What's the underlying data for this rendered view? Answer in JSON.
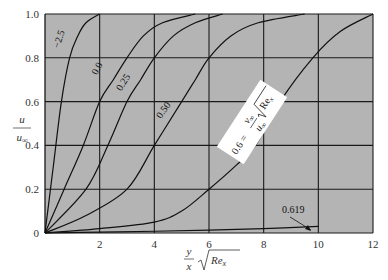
{
  "chart_data": {
    "type": "line",
    "title": "",
    "xlabel": "(y/x)·√Re_x",
    "ylabel": "u / u∞",
    "xlim": [
      0,
      12
    ],
    "ylim": [
      0,
      1.0
    ],
    "x_ticks": [
      "2",
      "4",
      "6",
      "8",
      "10",
      "12"
    ],
    "y_ticks": [
      "0",
      "0.2",
      "0.4",
      "0.6",
      "0.8",
      "1.0"
    ],
    "grid": true,
    "background": "#b4b4b4",
    "parameter_annotation": "0.6 = (v∞/u∞)·√Re_x",
    "series": [
      {
        "name": "−2.5",
        "x": [
          0,
          0.3,
          0.6,
          0.9,
          1.2,
          1.5,
          2.0
        ],
        "y": [
          0,
          0.3,
          0.6,
          0.8,
          0.9,
          0.96,
          1.0
        ]
      },
      {
        "name": "0.0",
        "x": [
          0,
          0.7,
          1.4,
          2.0,
          2.5,
          3.0,
          3.6,
          4.3,
          5.5
        ],
        "y": [
          0,
          0.2,
          0.4,
          0.6,
          0.7,
          0.8,
          0.9,
          0.96,
          1.0
        ]
      },
      {
        "name": "0.25",
        "x": [
          0,
          1.5,
          2.3,
          3.0,
          3.5,
          4.0,
          4.7,
          5.5,
          6.5
        ],
        "y": [
          0,
          0.2,
          0.4,
          0.6,
          0.7,
          0.8,
          0.9,
          0.96,
          1.0
        ]
      },
      {
        "name": "0.50",
        "x": [
          0,
          1.5,
          3.0,
          4.0,
          5.0,
          5.5,
          6.0,
          6.8,
          7.8,
          9.5
        ],
        "y": [
          0,
          0.08,
          0.2,
          0.4,
          0.6,
          0.7,
          0.8,
          0.9,
          0.96,
          1.0
        ]
      },
      {
        "name": "0.6",
        "x": [
          0,
          2.0,
          4.0,
          5.0,
          6.0,
          7.0,
          7.7,
          8.6,
          9.8,
          10.8,
          12.0
        ],
        "y": [
          0,
          0.02,
          0.05,
          0.1,
          0.2,
          0.31,
          0.4,
          0.6,
          0.8,
          0.92,
          1.0
        ]
      },
      {
        "name": "0.619",
        "x": [
          0,
          2,
          4,
          6,
          8,
          10
        ],
        "y": [
          0,
          0.004,
          0.008,
          0.013,
          0.02,
          0.03
        ]
      }
    ],
    "annotations": [
      {
        "text": "0.619",
        "x": 8.6,
        "y": 0.09,
        "arrow_to": [
          9.8,
          0.005
        ]
      }
    ]
  }
}
